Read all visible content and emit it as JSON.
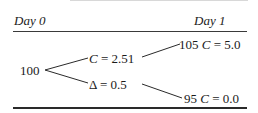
{
  "header": {
    "left_label": "Day 0",
    "right_label": "Day 1"
  },
  "tree": {
    "root": {
      "value": "100"
    },
    "middle": {
      "upper": {
        "symbol": "C",
        "eq": " = 2.51"
      },
      "lower": {
        "symbol": "Δ",
        "eq": " = 0.5"
      }
    },
    "leaves": {
      "up": {
        "price": "105 ",
        "symbol": "C",
        "eq": " = 5.0"
      },
      "down": {
        "price": "95 ",
        "symbol": "C",
        "eq": " = 0.0"
      }
    }
  },
  "colors": {
    "line": "#2a2a2a",
    "text": "#1a1a1a",
    "background": "#ffffff"
  }
}
